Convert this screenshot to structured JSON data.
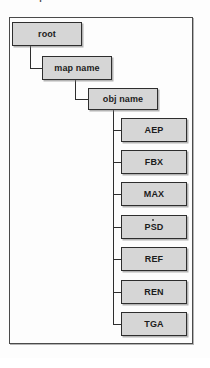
{
  "page": {
    "clipped_heading_text": "and sequences rendered from the file"
  },
  "diagram": {
    "type": "tree",
    "nodes": [
      {
        "id": "root",
        "label": "root",
        "x": 12,
        "y": 22,
        "w": 70,
        "h": 24
      },
      {
        "id": "map-name",
        "label": "map name",
        "x": 42,
        "y": 56,
        "w": 70,
        "h": 24
      },
      {
        "id": "obj-name",
        "label": "obj name",
        "x": 88,
        "y": 88,
        "w": 70,
        "h": 22
      }
    ],
    "leaves": [
      {
        "id": "aep",
        "label": "AEP"
      },
      {
        "id": "fbx",
        "label": "FBX"
      },
      {
        "id": "max",
        "label": "MAX"
      },
      {
        "id": "psd",
        "label": "PSD"
      },
      {
        "id": "ref",
        "label": "REF"
      },
      {
        "id": "ren",
        "label": "REN"
      },
      {
        "id": "tga",
        "label": "TGA"
      }
    ],
    "colors": {
      "box_fill": "#d6d6d6",
      "box_border": "#2e2e2e",
      "connector": "#2e2e2e",
      "frame_border": "#4a4a4a",
      "text": "#1c1c1c",
      "background": "#fdfdfd"
    }
  }
}
